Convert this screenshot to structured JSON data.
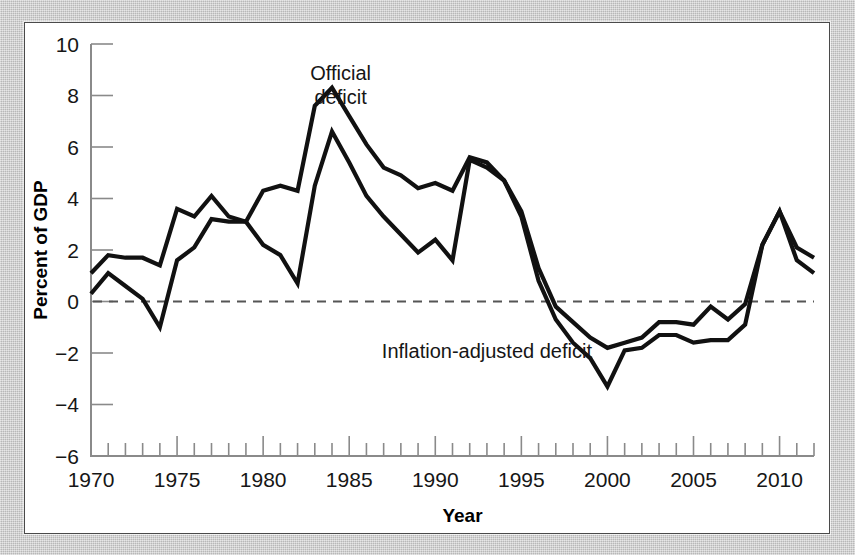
{
  "chart_data": {
    "type": "line",
    "title": "",
    "xlabel": "Year",
    "ylabel": "Percent of GDP",
    "xlim": [
      1970,
      2012
    ],
    "ylim": [
      -6,
      10
    ],
    "ytick_labels": [
      "10",
      "8",
      "6",
      "4",
      "2",
      "0",
      "−2",
      "−4",
      "−6"
    ],
    "ytick_values": [
      10,
      8,
      6,
      4,
      2,
      0,
      -2,
      -4,
      -6
    ],
    "xtick_labels": [
      "1970",
      "1975",
      "1980",
      "1985",
      "1990",
      "1995",
      "2000",
      "2005",
      "2010"
    ],
    "xtick_values": [
      1970,
      1975,
      1980,
      1985,
      1990,
      1995,
      2000,
      2005,
      2010
    ],
    "xtick_minor_step": 1,
    "grid": false,
    "legend_position": "inline-annotations",
    "zero_reference_line": 0,
    "annotations": [
      {
        "text": "Official deficit",
        "x": 1984.5,
        "y": 8.6
      },
      {
        "text": "Inflation-adjusted deficit",
        "x": 1993.0,
        "y": -2.2
      }
    ],
    "x": [
      1970,
      1971,
      1972,
      1973,
      1974,
      1975,
      1976,
      1977,
      1978,
      1979,
      1980,
      1981,
      1982,
      1983,
      1984,
      1985,
      1986,
      1987,
      1988,
      1989,
      1990,
      1991,
      1992,
      1993,
      1994,
      1995,
      1996,
      1997,
      1998,
      1999,
      2000,
      2001,
      2002,
      2003,
      2004,
      2005,
      2006,
      2007,
      2008,
      2009,
      2010,
      2011,
      2012
    ],
    "series": [
      {
        "name": "Official deficit",
        "values": [
          1.1,
          1.8,
          1.7,
          1.7,
          1.4,
          3.6,
          3.3,
          4.1,
          3.3,
          3.1,
          4.3,
          4.5,
          4.3,
          7.6,
          8.3,
          7.2,
          6.1,
          5.2,
          4.9,
          4.4,
          4.6,
          4.3,
          5.6,
          5.4,
          4.7,
          3.5,
          1.3,
          -0.2,
          -0.8,
          -1.4,
          -1.8,
          -1.6,
          -1.4,
          -0.8,
          -0.8,
          -0.9,
          -0.2,
          -0.7,
          -0.1,
          2.2,
          3.5,
          2.1,
          1.7
        ]
      },
      {
        "name": "Inflation-adjusted deficit",
        "values": [
          0.3,
          1.1,
          0.6,
          0.1,
          -1.0,
          1.6,
          2.1,
          3.2,
          3.1,
          3.1,
          2.2,
          1.8,
          0.7,
          4.5,
          6.6,
          5.4,
          4.1,
          3.3,
          2.6,
          1.9,
          2.4,
          1.6,
          5.5,
          5.2,
          4.7,
          3.3,
          0.8,
          -0.7,
          -1.6,
          -2.2,
          -3.3,
          -1.9,
          -1.8,
          -1.3,
          -1.3,
          -1.6,
          -1.5,
          -1.5,
          -0.9,
          2.2,
          3.5,
          1.6,
          1.1
        ]
      }
    ]
  },
  "labels": {
    "y_axis_title": "Percent of GDP",
    "x_axis_title": "Year",
    "official_line1": "Official",
    "official_line2": "deficit",
    "inflation_adjusted": "Inflation-adjusted deficit"
  }
}
